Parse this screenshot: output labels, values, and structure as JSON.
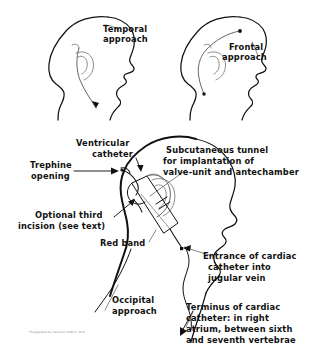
{
  "figure": {
    "background_color": "#ffffff",
    "ink_color": "#111111"
  },
  "panels": {
    "temporal": {
      "label_line1": "Temporal",
      "label_line2": "approach"
    },
    "frontal": {
      "label_line1": "Frontal",
      "label_line2": "approach"
    }
  },
  "main_labels": {
    "ventricular_catheter_line1": "Ventricular",
    "ventricular_catheter_line2": "catheter",
    "trephine_line1": "Trephine",
    "trephine_line2": "opening",
    "subcutaneous_line1": "Subcutaneous tunnel",
    "subcutaneous_line2": "for implantation of",
    "subcutaneous_line3": "valve-unit and antechamber",
    "optional_line1": "Optional third",
    "optional_line2": "incision (see text)",
    "red_band": "Red band",
    "occipital_line1": "Occipital",
    "occipital_line2": "approach",
    "entrance_line1": "Entrance of cardiac",
    "entrance_line2": "catheter into",
    "entrance_line3": "jugular vein",
    "terminus_line1": "Terminus of cardiac",
    "terminus_line2": "catheter: in right",
    "terminus_line3": "atrium, between sixth",
    "terminus_line4": "and seventh vertebrae"
  },
  "footnote": {
    "text": "*Suggested by Salomon Hakim, M.D."
  }
}
